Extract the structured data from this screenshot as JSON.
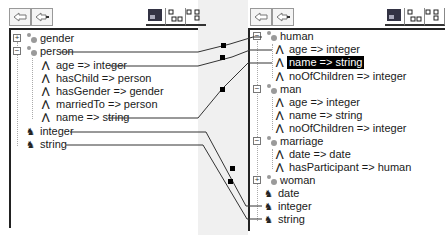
{
  "left_panel": {
    "toolbar": {
      "back_label": "back",
      "forward_label": "forward",
      "view_buttons": [
        "tree-view",
        "grid-view",
        "detail-view"
      ]
    },
    "tree": [
      {
        "type": "class",
        "label": "gender",
        "expander": "+",
        "indent": 0
      },
      {
        "type": "class",
        "label": "person",
        "expander": "-",
        "indent": 0
      },
      {
        "type": "attribute",
        "label": "age => integer",
        "indent": 1
      },
      {
        "type": "attribute",
        "label": "hasChild => person",
        "indent": 1
      },
      {
        "type": "attribute",
        "label": "hasGender => gender",
        "indent": 1
      },
      {
        "type": "attribute",
        "label": "marriedTo => person",
        "indent": 1
      },
      {
        "type": "attribute",
        "label": "name => string",
        "indent": 1
      },
      {
        "type": "datatype",
        "label": "integer",
        "indent": 0
      },
      {
        "type": "datatype",
        "label": "string",
        "indent": 0
      }
    ]
  },
  "right_panel": {
    "toolbar": {
      "back_label": "back",
      "forward_label": "forward",
      "view_buttons": [
        "tree-view",
        "grid-view",
        "detail-view"
      ]
    },
    "tree": [
      {
        "type": "class",
        "label": "human",
        "expander": "-",
        "indent": 0
      },
      {
        "type": "attribute",
        "label": "age => integer",
        "indent": 1
      },
      {
        "type": "attribute",
        "label": "name => string",
        "indent": 1,
        "selected": true
      },
      {
        "type": "attribute",
        "label": "noOfChildren => integer",
        "indent": 1
      },
      {
        "type": "class",
        "label": "man",
        "expander": "-",
        "indent": 0
      },
      {
        "type": "attribute",
        "label": "age => integer",
        "indent": 1
      },
      {
        "type": "attribute",
        "label": "name => string",
        "indent": 1
      },
      {
        "type": "attribute",
        "label": "noOfChildren => integer",
        "indent": 1
      },
      {
        "type": "class",
        "label": "marriage",
        "expander": "-",
        "indent": 0
      },
      {
        "type": "attribute",
        "label": "date => date",
        "indent": 1
      },
      {
        "type": "attribute",
        "label": "hasParticipant => human",
        "indent": 1
      },
      {
        "type": "class",
        "label": "woman",
        "expander": "+",
        "indent": 0
      },
      {
        "type": "datatype",
        "label": "date",
        "indent": 0
      },
      {
        "type": "datatype",
        "label": "integer",
        "indent": 0
      },
      {
        "type": "datatype",
        "label": "string",
        "indent": 0
      }
    ]
  },
  "mappings": [
    {
      "from": "person",
      "to": "human"
    },
    {
      "from": "age => integer",
      "to": "age => integer"
    },
    {
      "from": "name => string",
      "to": "name => string"
    },
    {
      "from": "integer",
      "to": "integer"
    },
    {
      "from": "string",
      "to": "string"
    }
  ],
  "colors": {
    "selection_bg": "#000000",
    "selection_fg": "#ffffff",
    "gutter": "#f0f0f0",
    "line": "#333333"
  }
}
